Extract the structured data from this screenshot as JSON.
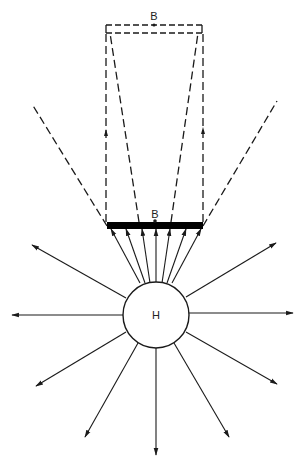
{
  "diagram": {
    "title": "",
    "colors": {
      "stroke": "#1a1a1a",
      "fill_bar": "#000000",
      "background": "#ffffff"
    },
    "center_body": {
      "label": "H",
      "cx": 156,
      "cy": 315,
      "r": 33
    },
    "lens_bar": {
      "label": "B",
      "x1": 107,
      "x2": 203,
      "y": 222,
      "height": 7
    },
    "image_plane": {
      "label": "B",
      "x1": 106,
      "x2": 202,
      "y_top": 25,
      "y_bottom": 33
    },
    "outer_dashed_rays": [
      {
        "from": [
          107,
          226
        ],
        "to": [
          32,
          104
        ]
      },
      {
        "from": [
          203,
          226
        ],
        "to": [
          277,
          101
        ]
      }
    ],
    "inner_dashed_rays": [
      {
        "from": [
          106,
          222
        ],
        "to": [
          106,
          33
        ],
        "arrow_at": [
          106,
          132
        ]
      },
      {
        "from": [
          139,
          222
        ],
        "to": [
          110,
          33
        ]
      },
      {
        "from": [
          171,
          222
        ],
        "to": [
          198,
          33
        ]
      },
      {
        "from": [
          203,
          222
        ],
        "to": [
          203,
          33
        ],
        "arrow_at": [
          203,
          130
        ]
      }
    ],
    "converging_arrows": [
      {
        "from": [
          140,
          283
        ],
        "to": [
          111,
          229
        ]
      },
      {
        "from": [
          145,
          283
        ],
        "to": [
          126,
          229
        ]
      },
      {
        "from": [
          150,
          283
        ],
        "to": [
          142,
          229
        ]
      },
      {
        "from": [
          156,
          283
        ],
        "to": [
          156,
          229
        ]
      },
      {
        "from": [
          162,
          283
        ],
        "to": [
          170,
          229
        ]
      },
      {
        "from": [
          167,
          283
        ],
        "to": [
          186,
          229
        ]
      },
      {
        "from": [
          172,
          283
        ],
        "to": [
          201,
          229
        ]
      }
    ],
    "radial_arrows": [
      {
        "from": [
          126,
          298
        ],
        "to": [
          32,
          245
        ]
      },
      {
        "from": [
          123,
          315
        ],
        "to": [
          12,
          315
        ]
      },
      {
        "from": [
          126,
          332
        ],
        "to": [
          36,
          386
        ]
      },
      {
        "from": [
          138,
          343
        ],
        "to": [
          85,
          437
        ]
      },
      {
        "from": [
          156,
          348
        ],
        "to": [
          156,
          455
        ]
      },
      {
        "from": [
          174,
          343
        ],
        "to": [
          229,
          437
        ]
      },
      {
        "from": [
          186,
          332
        ],
        "to": [
          277,
          384
        ]
      },
      {
        "from": [
          189,
          313
        ],
        "to": [
          293,
          313
        ]
      },
      {
        "from": [
          186,
          297
        ],
        "to": [
          276,
          243
        ]
      }
    ]
  }
}
